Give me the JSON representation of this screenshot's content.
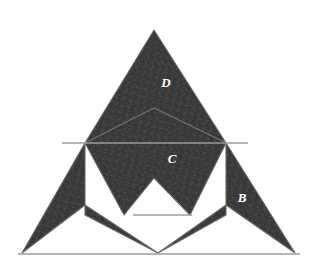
{
  "figure": {
    "background_color": "#ffffff",
    "piece_fill_color": "#3c3c3c",
    "piece_stroke_color": "#6e6e6e",
    "guide_line_color": "#9b9b9b",
    "label_color": "#ffffff",
    "texture": "speckled-mottled-fill"
  },
  "pieces": [
    {
      "id": "piece-a",
      "label": "A",
      "label_x": 104,
      "label_y": 199,
      "shape": "chevron",
      "points": "22,253 85,143 85,215 158,253 85,205"
    },
    {
      "id": "piece-b",
      "label": "B",
      "label_x": 242,
      "label_y": 199,
      "shape": "chevron",
      "points": "295,253 226,143 226,215 158,253 226,205"
    },
    {
      "id": "piece-c",
      "label": "C",
      "label_x": 172,
      "label_y": 160,
      "shape": "chevron",
      "points": "85,143 154,108 226,143 190,215 154,178 124,215"
    },
    {
      "id": "piece-d",
      "label": "D",
      "label_x": 166,
      "label_y": 84,
      "shape": "chevron",
      "points": "154,30 226,143 154,108 85,143"
    }
  ],
  "guide_lines": [
    {
      "id": "guide-upper-horizontal",
      "x1": 62,
      "y1": 143,
      "x2": 248,
      "y2": 143
    },
    {
      "id": "guide-lower-horizontal",
      "x1": 133,
      "y1": 215,
      "x2": 192,
      "y2": 215
    },
    {
      "id": "guide-base-horizontal",
      "x1": 18,
      "y1": 254,
      "x2": 300,
      "y2": 254
    }
  ],
  "labels": {
    "a": "A",
    "b": "B",
    "c": "C",
    "d": "D"
  }
}
